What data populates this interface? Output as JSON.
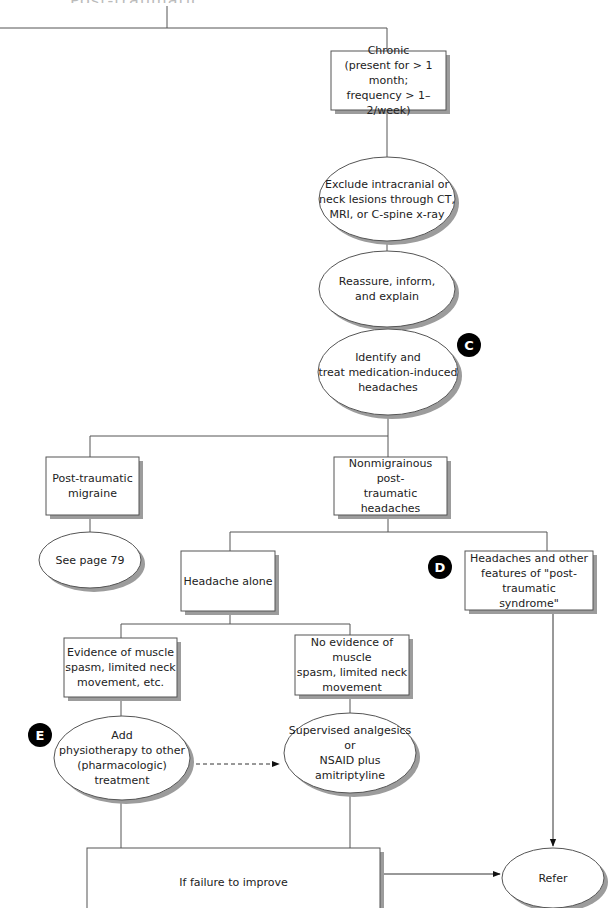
{
  "diagram": {
    "title_fragment": "Post-traumatic headache",
    "nodes": {
      "chronic": {
        "shape": "box",
        "lines": [
          "Chronic",
          "(present for > 1 month;",
          "frequency > 1–2/week)"
        ]
      },
      "exclude_lesions": {
        "shape": "ellipse",
        "lines": [
          "Exclude intracranial or",
          "neck lesions through CT,",
          "MRI, or C-spine x-ray"
        ]
      },
      "reassure": {
        "shape": "ellipse",
        "lines": [
          "Reassure, inform,",
          "and explain"
        ]
      },
      "identify_medication": {
        "shape": "ellipse",
        "lines": [
          "Identify and",
          "treat medication-induced",
          "headaches"
        ]
      },
      "post_traumatic_migraine": {
        "shape": "box",
        "lines": [
          "Post-traumatic",
          "migraine"
        ]
      },
      "nonmigrainous": {
        "shape": "box",
        "lines": [
          "Nonmigrainous post-",
          "traumatic headaches"
        ]
      },
      "see_page": {
        "shape": "ellipse",
        "lines": [
          "See page 79"
        ]
      },
      "headache_alone": {
        "shape": "box",
        "lines": [
          "Headache alone"
        ]
      },
      "post_traumatic_syndrome": {
        "shape": "box",
        "lines": [
          "Headaches and other",
          "features of \"post-traumatic",
          "syndrome\""
        ]
      },
      "evidence_spasm": {
        "shape": "box",
        "lines": [
          "Evidence of muscle",
          "spasm, limited neck",
          "movement, etc."
        ]
      },
      "no_evidence_spasm": {
        "shape": "box",
        "lines": [
          "No evidence of muscle",
          "spasm, limited neck",
          "movement"
        ]
      },
      "add_physio": {
        "shape": "ellipse",
        "lines": [
          "Add",
          "physiotherapy to other",
          "(pharmacologic)",
          "treatment"
        ]
      },
      "supervised_analgesics": {
        "shape": "ellipse",
        "lines": [
          "Supervised analgesics or",
          "NSAID plus amitriptyline"
        ]
      },
      "failure_to_improve": {
        "shape": "box",
        "lines": [
          "If failure to improve"
        ]
      },
      "refer": {
        "shape": "ellipse",
        "lines": [
          "Refer"
        ]
      }
    },
    "badges": {
      "c": "C",
      "d": "D",
      "e": "E"
    },
    "edges": [
      {
        "from": "top",
        "to": "chronic"
      },
      {
        "from": "chronic",
        "to": "exclude_lesions"
      },
      {
        "from": "exclude_lesions",
        "to": "reassure"
      },
      {
        "from": "reassure",
        "to": "identify_medication"
      },
      {
        "from": "identify_medication",
        "to": "post_traumatic_migraine"
      },
      {
        "from": "identify_medication",
        "to": "nonmigrainous"
      },
      {
        "from": "post_traumatic_migraine",
        "to": "see_page"
      },
      {
        "from": "nonmigrainous",
        "to": "headache_alone"
      },
      {
        "from": "nonmigrainous",
        "to": "post_traumatic_syndrome"
      },
      {
        "from": "headache_alone",
        "to": "evidence_spasm"
      },
      {
        "from": "headache_alone",
        "to": "no_evidence_spasm"
      },
      {
        "from": "evidence_spasm",
        "to": "add_physio"
      },
      {
        "from": "no_evidence_spasm",
        "to": "supervised_analgesics"
      },
      {
        "from": "add_physio",
        "to": "supervised_analgesics",
        "style": "dashed-arrow"
      },
      {
        "from": "add_physio",
        "to": "failure_to_improve"
      },
      {
        "from": "supervised_analgesics",
        "to": "failure_to_improve"
      },
      {
        "from": "failure_to_improve",
        "to": "refer",
        "style": "arrow"
      },
      {
        "from": "post_traumatic_syndrome",
        "to": "refer",
        "style": "arrow"
      }
    ],
    "colors": {
      "line": "#555555",
      "shadow": "#9a9a9a",
      "badge": "#000000",
      "text": "#222222"
    }
  }
}
